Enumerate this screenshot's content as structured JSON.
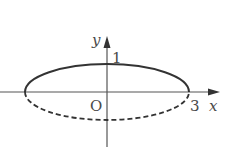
{
  "diagram": {
    "type": "ellipse-on-axes",
    "axes": {
      "x_label": "x",
      "y_label": "y",
      "origin_label": "O"
    },
    "ticks": {
      "y_tick": "1",
      "x_tick": "3"
    },
    "ellipse": {
      "center": [
        0,
        0
      ],
      "semi_major": 3,
      "semi_minor": 1,
      "upper_style": "solid",
      "lower_style": "dashed"
    },
    "colors": {
      "stroke": "#333333",
      "axis": "#555555",
      "text": "#4a4a4a",
      "background": "#ffffff"
    }
  }
}
